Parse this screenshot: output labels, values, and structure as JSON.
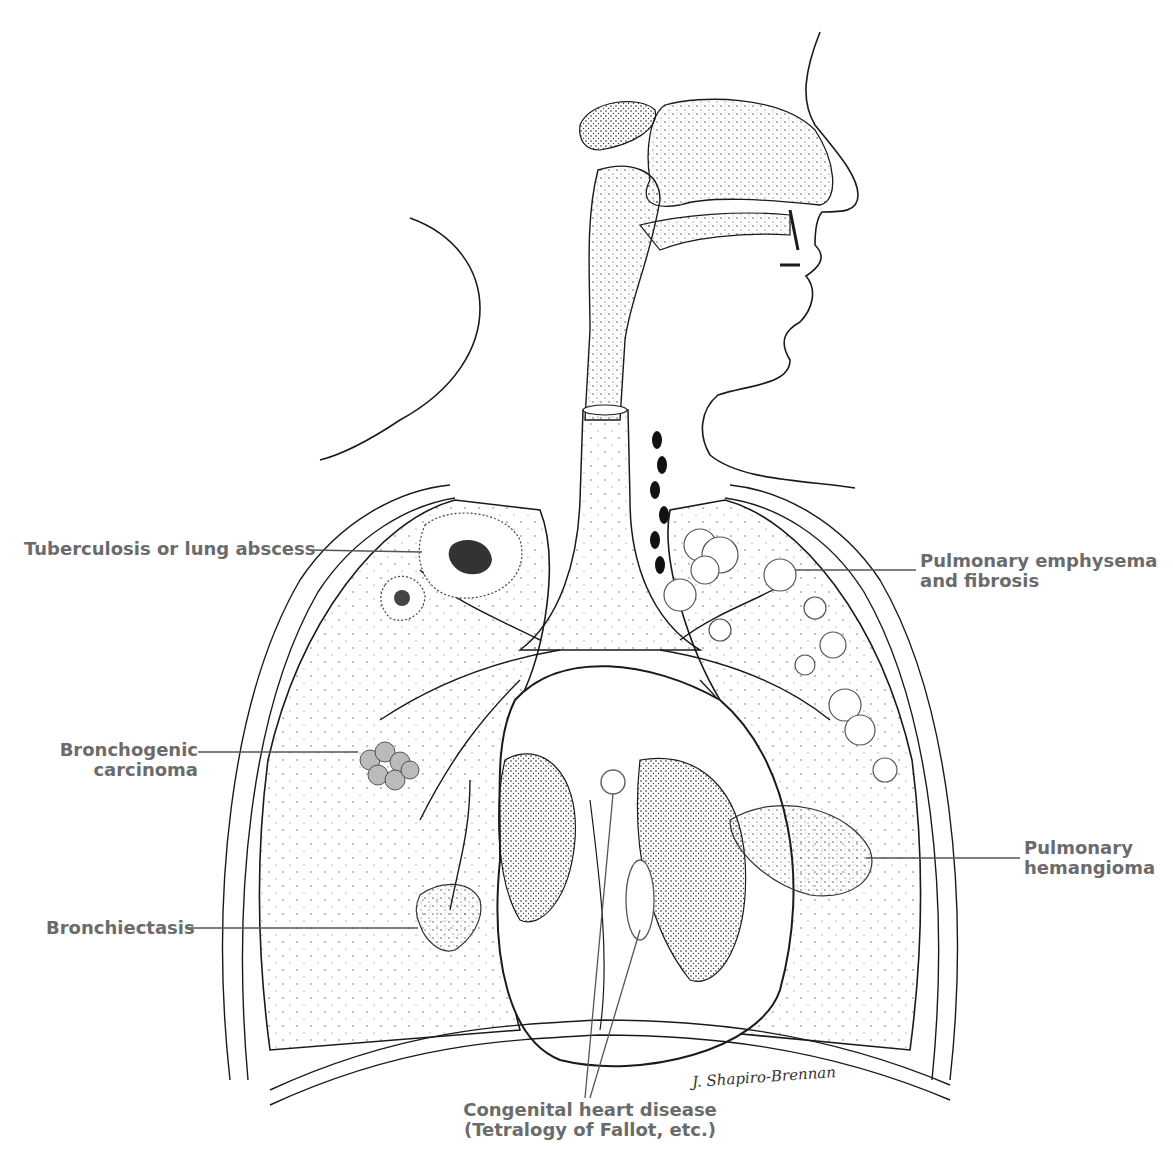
{
  "figure": {
    "title_visible": "",
    "title_note": "title cropped at top edge; unreadable",
    "leader_color": "#555555",
    "label_color": "#6b6b6b",
    "ink_color": "#1a1a1a"
  },
  "labels": [
    {
      "id": "tuberculosis",
      "text": "Tuberculosis or lung abscess",
      "side": "left"
    },
    {
      "id": "emphysema",
      "lines": [
        "Pulmonary emphysema",
        "and fibrosis"
      ],
      "side": "right"
    },
    {
      "id": "carcinoma",
      "lines": [
        "Bronchogenic",
        "carcinoma"
      ],
      "side": "left"
    },
    {
      "id": "hemangioma",
      "lines": [
        "Pulmonary",
        "hemangioma"
      ],
      "side": "right"
    },
    {
      "id": "bronchiectasis",
      "text": "Bronchiectasis",
      "side": "left"
    },
    {
      "id": "heart",
      "lines": [
        "Congenital heart disease",
        "(Tetralogy of Fallot, etc.)"
      ],
      "side": "bottom"
    }
  ],
  "signature": "J. Shapiro-Brennan"
}
